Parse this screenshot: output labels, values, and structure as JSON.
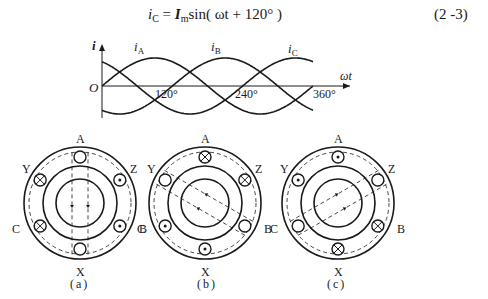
{
  "equation": {
    "lhs_var": "i",
    "lhs_sub": "C",
    "equals": "=",
    "amp_var": "I",
    "amp_sub": "m",
    "func": "sin",
    "arg": "( ωt + 120° )",
    "number": "(2 -3)"
  },
  "waveform": {
    "y_axis_label": "i",
    "x_axis_label": "ωt",
    "origin_label": "O",
    "ticks": [
      "120°",
      "240°",
      "360°"
    ],
    "curves": [
      {
        "name": "iA",
        "label_main": "i",
        "label_sub": "A",
        "phase_deg": 0
      },
      {
        "name": "iB",
        "label_main": "i",
        "label_sub": "B",
        "phase_deg": -120
      },
      {
        "name": "iC",
        "label_main": "i",
        "label_sub": "C",
        "phase_deg": 120
      }
    ]
  },
  "diagrams": [
    {
      "caption": "(a)",
      "labels": {
        "top": "A",
        "bottom": "X",
        "upper_left": "Y",
        "upper_right": "Z",
        "lower_left": "C",
        "lower_right": "B"
      },
      "slots": {
        "A": "empty",
        "Z": "dot",
        "B": "dot",
        "X": "empty",
        "C": "cross",
        "Y": "cross"
      },
      "flux_angle_deg": 90
    },
    {
      "caption": "(b)",
      "labels": {
        "top": "A",
        "bottom": "X",
        "upper_left": "Y",
        "upper_right": "Z",
        "lower_left": "C",
        "lower_right": "B"
      },
      "slots": {
        "A": "cross",
        "Z": "cross",
        "B": "empty",
        "X": "dot",
        "C": "dot",
        "Y": "empty"
      },
      "flux_angle_deg": 330
    },
    {
      "caption": "(c)",
      "labels": {
        "top": "A",
        "bottom": "X",
        "upper_left": "Y",
        "upper_right": "Z",
        "lower_left": "C",
        "lower_right": "B"
      },
      "slots": {
        "A": "dot",
        "Z": "empty",
        "B": "cross",
        "X": "cross",
        "C": "empty",
        "Y": "dot"
      },
      "flux_angle_deg": 210
    }
  ]
}
